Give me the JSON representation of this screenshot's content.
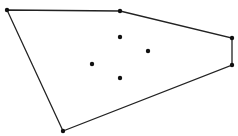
{
  "diagram": {
    "title": "",
    "type": "convex-hull",
    "colors": {
      "stroke": "#222222",
      "point": "#111111",
      "background": "#ffffff"
    },
    "hull_points": [
      {
        "x": 7,
        "y": 10
      },
      {
        "x": 120,
        "y": 11
      },
      {
        "x": 232,
        "y": 38
      },
      {
        "x": 232,
        "y": 65
      },
      {
        "x": 63,
        "y": 131
      }
    ],
    "interior_points": [
      {
        "x": 120,
        "y": 37
      },
      {
        "x": 148,
        "y": 51
      },
      {
        "x": 92,
        "y": 64
      },
      {
        "x": 120,
        "y": 78
      }
    ]
  }
}
